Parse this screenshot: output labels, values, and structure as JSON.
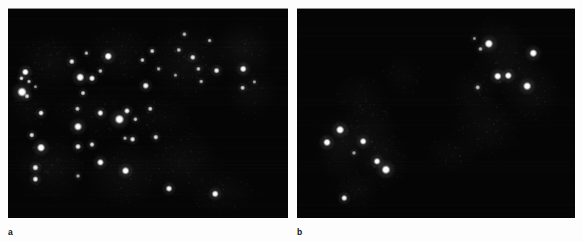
{
  "figure": {
    "background_color": "#ffffff",
    "panel_background_color": "#050505",
    "signal_color": "#ffffff",
    "tissue_color": "#4a4a4a",
    "label_color": "#111111",
    "modality": "fluorescence-micrograph",
    "panels": [
      {
        "id": "a",
        "label": "a",
        "x": 8,
        "y": 8,
        "width": 280,
        "height": 210,
        "signal_count": 44,
        "description": "Dark-field fluorescence micrograph with numerous bright punctate signals distributed across faint grey cell clusters",
        "tissue_blobs": [
          {
            "cx": 0.155,
            "cy": 0.255,
            "rx": 0.115,
            "ry": 0.135,
            "opacity": 0.115
          },
          {
            "cx": 0.15,
            "cy": 0.76,
            "rx": 0.13,
            "ry": 0.15,
            "opacity": 0.125
          },
          {
            "cx": 0.395,
            "cy": 0.215,
            "rx": 0.125,
            "ry": 0.14,
            "opacity": 0.105
          },
          {
            "cx": 0.42,
            "cy": 0.79,
            "rx": 0.14,
            "ry": 0.155,
            "opacity": 0.13
          },
          {
            "cx": 0.64,
            "cy": 0.255,
            "rx": 0.145,
            "ry": 0.175,
            "opacity": 0.13
          },
          {
            "cx": 0.62,
            "cy": 0.735,
            "rx": 0.135,
            "ry": 0.16,
            "opacity": 0.115
          },
          {
            "cx": 0.84,
            "cy": 0.2,
            "rx": 0.11,
            "ry": 0.145,
            "opacity": 0.155
          },
          {
            "cx": 0.87,
            "cy": 0.4,
            "rx": 0.095,
            "ry": 0.12,
            "opacity": 0.11
          },
          {
            "cx": 0.3,
            "cy": 0.5,
            "rx": 0.155,
            "ry": 0.11,
            "opacity": 0.075
          },
          {
            "cx": 0.53,
            "cy": 0.52,
            "rx": 0.13,
            "ry": 0.1,
            "opacity": 0.07
          },
          {
            "cx": 0.075,
            "cy": 0.48,
            "rx": 0.075,
            "ry": 0.09,
            "opacity": 0.08
          },
          {
            "cx": 0.76,
            "cy": 0.87,
            "rx": 0.12,
            "ry": 0.11,
            "opacity": 0.095
          }
        ],
        "signals": [
          {
            "x": 0.062,
            "y": 0.305,
            "r": 2.2,
            "i": 0.92
          },
          {
            "x": 0.048,
            "y": 0.335,
            "r": 1.5,
            "i": 0.7
          },
          {
            "x": 0.075,
            "y": 0.35,
            "r": 1.4,
            "i": 0.62
          },
          {
            "x": 0.05,
            "y": 0.4,
            "r": 3.0,
            "i": 0.96
          },
          {
            "x": 0.068,
            "y": 0.42,
            "r": 1.6,
            "i": 0.66
          },
          {
            "x": 0.098,
            "y": 0.375,
            "r": 1.2,
            "i": 0.5
          },
          {
            "x": 0.228,
            "y": 0.255,
            "r": 1.8,
            "i": 0.74
          },
          {
            "x": 0.28,
            "y": 0.215,
            "r": 1.4,
            "i": 0.6
          },
          {
            "x": 0.3,
            "y": 0.335,
            "r": 2.0,
            "i": 0.85
          },
          {
            "x": 0.258,
            "y": 0.33,
            "r": 2.6,
            "i": 0.92
          },
          {
            "x": 0.358,
            "y": 0.23,
            "r": 2.4,
            "i": 0.95
          },
          {
            "x": 0.33,
            "y": 0.3,
            "r": 1.5,
            "i": 0.62
          },
          {
            "x": 0.268,
            "y": 0.405,
            "r": 1.6,
            "i": 0.7
          },
          {
            "x": 0.118,
            "y": 0.5,
            "r": 1.8,
            "i": 0.78
          },
          {
            "x": 0.248,
            "y": 0.48,
            "r": 1.6,
            "i": 0.66
          },
          {
            "x": 0.33,
            "y": 0.5,
            "r": 2.0,
            "i": 0.82
          },
          {
            "x": 0.25,
            "y": 0.565,
            "r": 2.6,
            "i": 0.9
          },
          {
            "x": 0.085,
            "y": 0.605,
            "r": 1.7,
            "i": 0.72
          },
          {
            "x": 0.118,
            "y": 0.665,
            "r": 2.6,
            "i": 0.95
          },
          {
            "x": 0.098,
            "y": 0.76,
            "r": 2.0,
            "i": 0.8
          },
          {
            "x": 0.25,
            "y": 0.66,
            "r": 1.9,
            "i": 0.78
          },
          {
            "x": 0.3,
            "y": 0.65,
            "r": 1.7,
            "i": 0.72
          },
          {
            "x": 0.33,
            "y": 0.735,
            "r": 2.2,
            "i": 0.88
          },
          {
            "x": 0.25,
            "y": 0.8,
            "r": 1.4,
            "i": 0.55
          },
          {
            "x": 0.098,
            "y": 0.815,
            "r": 1.9,
            "i": 0.8
          },
          {
            "x": 0.42,
            "y": 0.775,
            "r": 2.4,
            "i": 0.92
          },
          {
            "x": 0.455,
            "y": 0.53,
            "r": 1.5,
            "i": 0.62
          },
          {
            "x": 0.425,
            "y": 0.49,
            "r": 1.9,
            "i": 0.8
          },
          {
            "x": 0.398,
            "y": 0.53,
            "r": 3.0,
            "i": 0.97
          },
          {
            "x": 0.445,
            "y": 0.625,
            "r": 1.8,
            "i": 0.76
          },
          {
            "x": 0.418,
            "y": 0.62,
            "r": 1.4,
            "i": 0.58
          },
          {
            "x": 0.48,
            "y": 0.248,
            "r": 1.5,
            "i": 0.64
          },
          {
            "x": 0.515,
            "y": 0.205,
            "r": 1.6,
            "i": 0.68
          },
          {
            "x": 0.538,
            "y": 0.29,
            "r": 1.4,
            "i": 0.56
          },
          {
            "x": 0.492,
            "y": 0.37,
            "r": 2.1,
            "i": 0.84
          },
          {
            "x": 0.508,
            "y": 0.48,
            "r": 1.6,
            "i": 0.68
          },
          {
            "x": 0.528,
            "y": 0.615,
            "r": 1.7,
            "i": 0.72
          },
          {
            "x": 0.61,
            "y": 0.2,
            "r": 1.5,
            "i": 0.62
          },
          {
            "x": 0.66,
            "y": 0.235,
            "r": 1.8,
            "i": 0.74
          },
          {
            "x": 0.68,
            "y": 0.29,
            "r": 1.5,
            "i": 0.62
          },
          {
            "x": 0.69,
            "y": 0.35,
            "r": 1.4,
            "i": 0.58
          },
          {
            "x": 0.72,
            "y": 0.155,
            "r": 1.4,
            "i": 0.56
          },
          {
            "x": 0.745,
            "y": 0.298,
            "r": 1.9,
            "i": 0.78
          },
          {
            "x": 0.84,
            "y": 0.29,
            "r": 2.2,
            "i": 0.86
          },
          {
            "x": 0.88,
            "y": 0.352,
            "r": 1.3,
            "i": 0.52
          },
          {
            "x": 0.838,
            "y": 0.38,
            "r": 1.6,
            "i": 0.66
          },
          {
            "x": 0.63,
            "y": 0.125,
            "r": 1.5,
            "i": 0.58
          },
          {
            "x": 0.598,
            "y": 0.32,
            "r": 1.3,
            "i": 0.5
          },
          {
            "x": 0.575,
            "y": 0.86,
            "r": 2.1,
            "i": 0.84
          },
          {
            "x": 0.74,
            "y": 0.885,
            "r": 2.2,
            "i": 0.88
          }
        ]
      },
      {
        "id": "b",
        "label": "b",
        "x": 297,
        "y": 8,
        "width": 278,
        "height": 210,
        "signal_count": 14,
        "description": "Dark-field fluorescence micrograph with far fewer bright punctate signals grouped in two clusters over faint grey cell structures",
        "tissue_blobs": [
          {
            "cx": 0.155,
            "cy": 0.66,
            "rx": 0.09,
            "ry": 0.17,
            "opacity": 0.135
          },
          {
            "cx": 0.255,
            "cy": 0.6,
            "rx": 0.11,
            "ry": 0.17,
            "opacity": 0.125
          },
          {
            "cx": 0.31,
            "cy": 0.73,
            "rx": 0.095,
            "ry": 0.13,
            "opacity": 0.115
          },
          {
            "cx": 0.21,
            "cy": 0.86,
            "rx": 0.085,
            "ry": 0.1,
            "opacity": 0.1
          },
          {
            "cx": 0.225,
            "cy": 0.42,
            "rx": 0.095,
            "ry": 0.11,
            "opacity": 0.085
          },
          {
            "cx": 0.68,
            "cy": 0.56,
            "rx": 0.125,
            "ry": 0.145,
            "opacity": 0.105
          },
          {
            "cx": 0.76,
            "cy": 0.27,
            "rx": 0.125,
            "ry": 0.16,
            "opacity": 0.13
          },
          {
            "cx": 0.845,
            "cy": 0.4,
            "rx": 0.105,
            "ry": 0.145,
            "opacity": 0.12
          },
          {
            "cx": 0.72,
            "cy": 0.15,
            "rx": 0.1,
            "ry": 0.11,
            "opacity": 0.095
          },
          {
            "cx": 0.635,
            "cy": 0.4,
            "rx": 0.09,
            "ry": 0.12,
            "opacity": 0.08
          },
          {
            "cx": 0.38,
            "cy": 0.32,
            "rx": 0.075,
            "ry": 0.095,
            "opacity": 0.065
          },
          {
            "cx": 0.56,
            "cy": 0.69,
            "rx": 0.1,
            "ry": 0.09,
            "opacity": 0.07
          }
        ],
        "signals": [
          {
            "x": 0.155,
            "y": 0.58,
            "r": 2.6,
            "i": 0.95
          },
          {
            "x": 0.108,
            "y": 0.64,
            "r": 2.4,
            "i": 0.92
          },
          {
            "x": 0.238,
            "y": 0.635,
            "r": 2.2,
            "i": 0.88
          },
          {
            "x": 0.288,
            "y": 0.73,
            "r": 2.2,
            "i": 0.86
          },
          {
            "x": 0.32,
            "y": 0.77,
            "r": 2.8,
            "i": 0.97
          },
          {
            "x": 0.17,
            "y": 0.905,
            "r": 2.0,
            "i": 0.82
          },
          {
            "x": 0.205,
            "y": 0.69,
            "r": 1.4,
            "i": 0.52
          },
          {
            "x": 0.69,
            "y": 0.17,
            "r": 2.7,
            "i": 0.96
          },
          {
            "x": 0.66,
            "y": 0.195,
            "r": 1.5,
            "i": 0.58
          },
          {
            "x": 0.85,
            "y": 0.215,
            "r": 2.5,
            "i": 0.93
          },
          {
            "x": 0.722,
            "y": 0.325,
            "r": 2.4,
            "i": 0.92
          },
          {
            "x": 0.76,
            "y": 0.322,
            "r": 2.3,
            "i": 0.9
          },
          {
            "x": 0.828,
            "y": 0.372,
            "r": 2.6,
            "i": 0.95
          },
          {
            "x": 0.65,
            "y": 0.378,
            "r": 1.6,
            "i": 0.62
          },
          {
            "x": 0.638,
            "y": 0.145,
            "r": 1.3,
            "i": 0.46
          }
        ]
      }
    ]
  }
}
